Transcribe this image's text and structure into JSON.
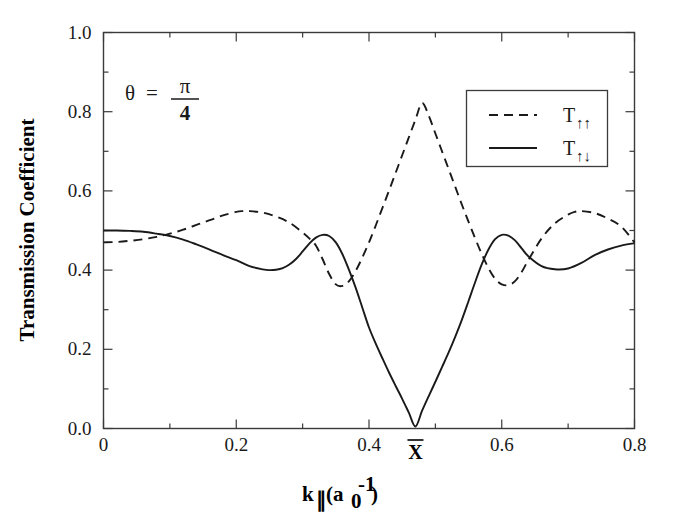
{
  "figure": {
    "background_color": "#ffffff",
    "line_color": "#1a1a1a",
    "frame_color": "#3a3a3a"
  },
  "annotation": {
    "theta_symbol": "θ",
    "equals": "=",
    "numerator": "π",
    "denominator": "4"
  },
  "xbar_marker": {
    "label": "X",
    "x_value": 0.47
  },
  "legend": {
    "entries": [
      {
        "label": "T",
        "sub": "↑↑",
        "style": "dashed"
      },
      {
        "label": "T",
        "sub": "↑↓",
        "style": "solid"
      }
    ]
  },
  "chart_data": {
    "type": "line",
    "title": "",
    "xlabel": "k∥ (a₀⁻¹)",
    "ylabel": "Transmission Coefficient",
    "xlim": [
      0.0,
      0.8
    ],
    "ylim": [
      0.0,
      1.0
    ],
    "xticks": [
      0.0,
      0.2,
      0.4,
      0.6,
      0.8
    ],
    "xticklabels": [
      "0",
      "0.2",
      "0.4",
      "0.6",
      "0.8"
    ],
    "xminor_step": 0.1,
    "yticks": [
      0.0,
      0.2,
      0.4,
      0.6,
      0.8,
      1.0
    ],
    "yticklabels": [
      "0.0",
      "0.2",
      "0.4",
      "0.6",
      "0.8",
      "1.0"
    ],
    "yminor_step": 0.1,
    "grid": false,
    "legend_position": "upper right",
    "annotations": [
      {
        "text": "θ = π/4",
        "x": 0.08,
        "y": 0.85
      },
      {
        "text": "X̄",
        "x": 0.47,
        "y": 0.0
      }
    ],
    "series": [
      {
        "name": "T_up_up",
        "label": "T↑↑",
        "style": "dashed",
        "x": [
          0.0,
          0.02,
          0.04,
          0.06,
          0.08,
          0.1,
          0.12,
          0.14,
          0.16,
          0.18,
          0.2,
          0.21,
          0.22,
          0.24,
          0.26,
          0.28,
          0.3,
          0.31,
          0.32,
          0.33,
          0.34,
          0.35,
          0.36,
          0.37,
          0.38,
          0.39,
          0.4,
          0.41,
          0.42,
          0.43,
          0.44,
          0.45,
          0.46,
          0.47,
          0.48,
          0.49,
          0.5,
          0.51,
          0.52,
          0.53,
          0.54,
          0.55,
          0.56,
          0.57,
          0.58,
          0.59,
          0.6,
          0.61,
          0.62,
          0.63,
          0.64,
          0.66,
          0.68,
          0.7,
          0.71,
          0.72,
          0.74,
          0.76,
          0.78,
          0.8
        ],
        "y": [
          0.47,
          0.471,
          0.474,
          0.478,
          0.484,
          0.492,
          0.502,
          0.514,
          0.526,
          0.538,
          0.547,
          0.549,
          0.549,
          0.545,
          0.535,
          0.52,
          0.495,
          0.48,
          0.462,
          0.428,
          0.39,
          0.364,
          0.36,
          0.372,
          0.398,
          0.432,
          0.47,
          0.512,
          0.556,
          0.6,
          0.645,
          0.69,
          0.735,
          0.78,
          0.822,
          0.79,
          0.745,
          0.7,
          0.655,
          0.61,
          0.565,
          0.522,
          0.48,
          0.44,
          0.405,
          0.378,
          0.364,
          0.362,
          0.372,
          0.395,
          0.425,
          0.48,
          0.518,
          0.54,
          0.547,
          0.549,
          0.544,
          0.53,
          0.51,
          0.47
        ]
      },
      {
        "name": "T_up_down",
        "label": "T↑↓",
        "style": "solid",
        "x": [
          0.0,
          0.02,
          0.04,
          0.06,
          0.08,
          0.1,
          0.12,
          0.14,
          0.16,
          0.18,
          0.2,
          0.22,
          0.24,
          0.25,
          0.26,
          0.27,
          0.28,
          0.29,
          0.3,
          0.31,
          0.32,
          0.33,
          0.34,
          0.35,
          0.36,
          0.37,
          0.38,
          0.39,
          0.4,
          0.41,
          0.42,
          0.43,
          0.44,
          0.45,
          0.46,
          0.47,
          0.48,
          0.49,
          0.5,
          0.51,
          0.52,
          0.53,
          0.54,
          0.55,
          0.56,
          0.57,
          0.58,
          0.59,
          0.6,
          0.61,
          0.62,
          0.63,
          0.64,
          0.66,
          0.68,
          0.7,
          0.72,
          0.74,
          0.76,
          0.78,
          0.8
        ],
        "y": [
          0.5,
          0.5,
          0.499,
          0.497,
          0.492,
          0.486,
          0.477,
          0.465,
          0.452,
          0.438,
          0.425,
          0.41,
          0.402,
          0.4,
          0.401,
          0.405,
          0.414,
          0.428,
          0.447,
          0.467,
          0.482,
          0.489,
          0.486,
          0.47,
          0.44,
          0.4,
          0.355,
          0.305,
          0.255,
          0.215,
          0.178,
          0.142,
          0.108,
          0.075,
          0.04,
          0.005,
          0.045,
          0.082,
          0.118,
          0.155,
          0.192,
          0.232,
          0.275,
          0.322,
          0.37,
          0.415,
          0.452,
          0.478,
          0.489,
          0.487,
          0.475,
          0.455,
          0.435,
          0.41,
          0.402,
          0.404,
          0.418,
          0.438,
          0.452,
          0.462,
          0.468
        ]
      }
    ]
  }
}
